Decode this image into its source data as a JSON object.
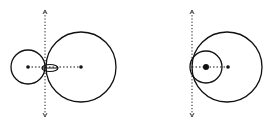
{
  "diagram": {
    "stroke_color": "#111111",
    "background": "#ffffff",
    "figures": [
      {
        "name": "left-figure",
        "axis": {
          "x": 45,
          "y1": 10,
          "y2": 117
        },
        "circles": [
          {
            "cx": 28,
            "cy": 67,
            "r": 17
          },
          {
            "cx": 81,
            "cy": 67,
            "r": 35
          }
        ],
        "ellipse": {
          "cx": 50,
          "cy": 68,
          "rx": 8,
          "ry": 3.5
        },
        "centerline": {
          "x1": 28,
          "x2": 81,
          "y": 67
        },
        "dots": [
          {
            "cx": 28,
            "cy": 67,
            "r": 1.8
          },
          {
            "cx": 81,
            "cy": 67,
            "r": 1.8
          }
        ]
      },
      {
        "name": "right-figure",
        "axis": {
          "x": 192,
          "y1": 10,
          "y2": 117
        },
        "circles": [
          {
            "cx": 227,
            "cy": 67,
            "r": 35
          },
          {
            "cx": 206,
            "cy": 67,
            "r": 16
          }
        ],
        "centerline": {
          "x1": 192,
          "x2": 228,
          "y": 67
        },
        "dots": [
          {
            "cx": 206,
            "cy": 67,
            "r": 3
          },
          {
            "cx": 228,
            "cy": 67,
            "r": 1.8
          }
        ]
      }
    ]
  }
}
